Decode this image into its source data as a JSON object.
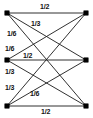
{
  "figure": {
    "type": "weighted-bipartite-graph-diagram",
    "width": 93,
    "height": 118,
    "background_color": "#ffffff",
    "line_color": "#1a1a1a",
    "node_color": "#000000",
    "label_color": "#111111"
  },
  "nodes": [
    {
      "id": "L1",
      "side": "left",
      "x": 7,
      "y": 13,
      "label": ""
    },
    {
      "id": "L2",
      "side": "left",
      "x": 7,
      "y": 60,
      "label": ""
    },
    {
      "id": "L3",
      "side": "left",
      "x": 7,
      "y": 106,
      "label": ""
    },
    {
      "id": "R1",
      "side": "right",
      "x": 86,
      "y": 13,
      "label": ""
    },
    {
      "id": "R2",
      "side": "right",
      "x": 86,
      "y": 60,
      "label": ""
    },
    {
      "id": "R3",
      "side": "right",
      "x": 86,
      "y": 106,
      "label": ""
    }
  ],
  "edges": [
    {
      "id": "e1",
      "from": "L1",
      "to": "R1",
      "weight": "1/2",
      "x1": 7,
      "y1": 13,
      "x2": 86,
      "y2": 13
    },
    {
      "id": "e2",
      "from": "L1",
      "to": "R2",
      "weight": "1/3",
      "x1": 7,
      "y1": 13,
      "x2": 86,
      "y2": 60
    },
    {
      "id": "e3",
      "from": "L1",
      "to": "R3",
      "weight": "1/6",
      "x1": 7,
      "y1": 13,
      "x2": 86,
      "y2": 106
    },
    {
      "id": "e4",
      "from": "L2",
      "to": "R1",
      "weight": "1/6",
      "x1": 7,
      "y1": 60,
      "x2": 86,
      "y2": 13
    },
    {
      "id": "e5",
      "from": "L2",
      "to": "R2",
      "weight": "1/2",
      "x1": 7,
      "y1": 60,
      "x2": 86,
      "y2": 60
    },
    {
      "id": "e6",
      "from": "L2",
      "to": "R3",
      "weight": "1/3",
      "x1": 7,
      "y1": 60,
      "x2": 86,
      "y2": 106
    },
    {
      "id": "e7",
      "from": "L3",
      "to": "R1",
      "weight": "1/3",
      "x1": 7,
      "y1": 106,
      "x2": 86,
      "y2": 13
    },
    {
      "id": "e8",
      "from": "L3",
      "to": "R2",
      "weight": "1/6",
      "x1": 7,
      "y1": 106,
      "x2": 86,
      "y2": 60
    },
    {
      "id": "e9",
      "from": "L3",
      "to": "R3",
      "weight": "1/2",
      "x1": 7,
      "y1": 106,
      "x2": 86,
      "y2": 106
    }
  ],
  "labels": [
    {
      "id": "lbl-1",
      "edge": "e1",
      "text": "1/2",
      "x": 40,
      "y": 3
    },
    {
      "id": "lbl-2",
      "edge": "e2",
      "text": "1/3",
      "x": 31,
      "y": 20
    },
    {
      "id": "lbl-3",
      "edge": "e3",
      "text": "1/6",
      "x": 7,
      "y": 30
    },
    {
      "id": "lbl-4",
      "edge": "e4",
      "text": "1/6",
      "x": 5,
      "y": 45
    },
    {
      "id": "lbl-5",
      "edge": "e5",
      "text": "1/2",
      "x": 23,
      "y": 52
    },
    {
      "id": "lbl-6",
      "edge": "e6",
      "text": "1/3",
      "x": 5,
      "y": 68
    },
    {
      "id": "lbl-7",
      "edge": "e7",
      "text": "1/3",
      "x": 5,
      "y": 84
    },
    {
      "id": "lbl-8",
      "edge": "e8",
      "text": "1/6",
      "x": 30,
      "y": 90
    },
    {
      "id": "lbl-9",
      "edge": "e9",
      "text": "1/2",
      "x": 41,
      "y": 108
    }
  ]
}
